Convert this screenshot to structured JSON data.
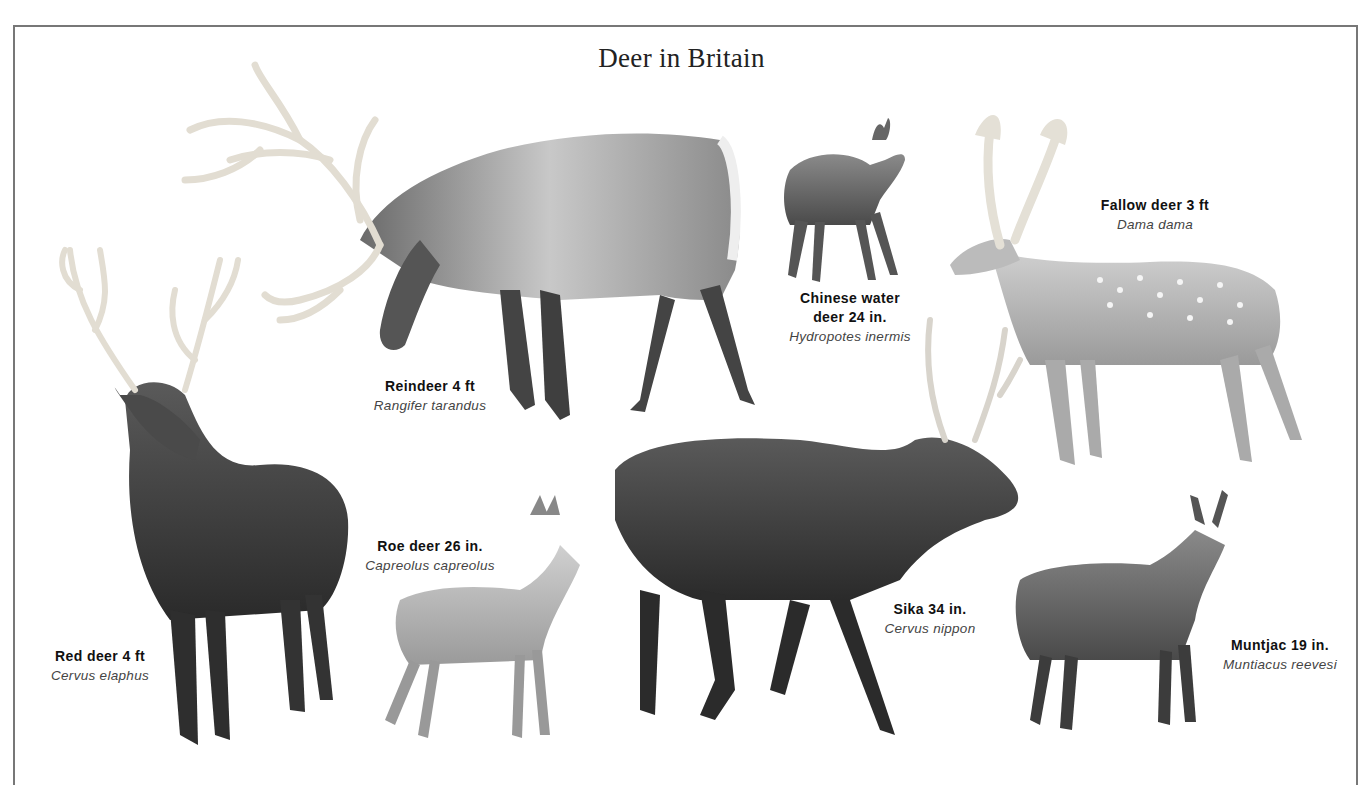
{
  "title": "Deer in Britain",
  "species": [
    {
      "id": "reindeer",
      "common": "Reindeer 4 ft",
      "latin": "Rangifer tarandus"
    },
    {
      "id": "chinese-water-deer",
      "common": "Chinese water deer 24 in.",
      "common_line1": "Chinese water",
      "common_line2": "deer 24 in.",
      "latin": "Hydropotes inermis"
    },
    {
      "id": "fallow-deer",
      "common": "Fallow deer 3 ft",
      "latin": "Dama dama"
    },
    {
      "id": "red-deer",
      "common": "Red deer 4 ft",
      "latin": "Cervus elaphus"
    },
    {
      "id": "roe-deer",
      "common": "Roe deer 26 in.",
      "latin": "Capreolus capreolus"
    },
    {
      "id": "sika",
      "common": "Sika 34 in.",
      "latin": "Cervus nippon"
    },
    {
      "id": "muntjac",
      "common": "Muntjac 19 in.",
      "latin": "Muntiacus reevesi"
    }
  ],
  "colors": {
    "border": "#777777",
    "dark_fur": "#3a3a3a",
    "mid_fur": "#6e6e6e",
    "light_fur": "#bdbdbd",
    "antler": "#d8d4cc"
  }
}
